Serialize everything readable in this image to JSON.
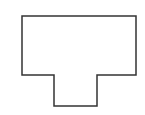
{
  "diagram": {
    "type": "outline-shape",
    "shape_name": "T-shaped polygon",
    "background": "#ffffff",
    "stroke_color": "#333333",
    "stroke_width": 1.5,
    "fill": "none",
    "points": [
      [
        22,
        16
      ],
      [
        136,
        16
      ],
      [
        136,
        75
      ],
      [
        97,
        75
      ],
      [
        97,
        106
      ],
      [
        54,
        106
      ],
      [
        54,
        75
      ],
      [
        22,
        75
      ]
    ]
  }
}
